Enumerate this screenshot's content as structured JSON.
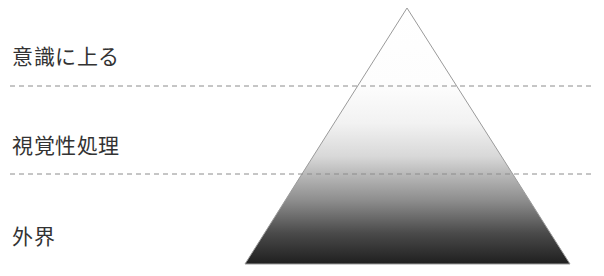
{
  "figure": {
    "background_color": "#ffffff",
    "width": 604,
    "height": 276
  },
  "labels": [
    {
      "id": "conscious",
      "text": "意識に上る",
      "color": "#333333",
      "x": 12,
      "y": 46
    },
    {
      "id": "visual",
      "text": "視覚性処理",
      "color": "#333333",
      "x": 12,
      "y": 135
    },
    {
      "id": "external",
      "text": "外界",
      "color": "#333333",
      "x": 12,
      "y": 226
    }
  ],
  "pyramid": {
    "apex": {
      "x": 407,
      "y": 8
    },
    "base_left": {
      "x": 245,
      "y": 264
    },
    "base_right": {
      "x": 570,
      "y": 264
    },
    "outline_color": "#9a9a9a",
    "outline_width": 1,
    "gradient": {
      "direction": "top-to-bottom",
      "stops": [
        {
          "offset": "0%",
          "color": "#ffffff"
        },
        {
          "offset": "30%",
          "color": "#fdfdfd"
        },
        {
          "offset": "45%",
          "color": "#f2f2f2"
        },
        {
          "offset": "58%",
          "color": "#d8d8d8"
        },
        {
          "offset": "64%",
          "color": "#bdbdbd"
        },
        {
          "offset": "75%",
          "color": "#8e8e8e"
        },
        {
          "offset": "88%",
          "color": "#4a4a4a"
        },
        {
          "offset": "100%",
          "color": "#1f1f1f"
        }
      ]
    }
  },
  "divider_lines": [
    {
      "id": "upper",
      "y": 86,
      "x_start": 10,
      "x_end": 595,
      "color": "#8c8c8c",
      "dash": "5,4"
    },
    {
      "id": "lower",
      "y": 174,
      "x_start": 10,
      "x_end": 595,
      "color": "#8c8c8c",
      "dash": "5,4"
    }
  ]
}
